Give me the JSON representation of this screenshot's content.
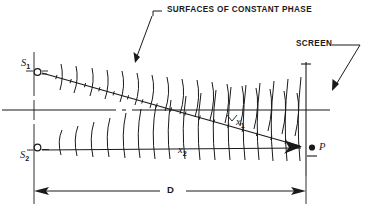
{
  "figure": {
    "kind": "optics-interference-diagram",
    "title_annotation": "SURFACES OF CONSTANT PHASE",
    "screen_annotation": "SCREEN",
    "background_color": "#ffffff",
    "ink_color": "#1a1a1a"
  },
  "labels": {
    "surfaces_of_constant_phase": "SURFACES OF CONSTANT PHASE",
    "screen": "SCREEN",
    "source_1": "S",
    "source_1_sub": "1",
    "source_2": "S",
    "source_2_sub": "2",
    "path_1": "x",
    "path_1_sub": "1",
    "path_2": "x",
    "path_2_sub": "2",
    "point_p": "P",
    "dimension_d": "D"
  },
  "geometry": {
    "source_axis_x": 34,
    "source_1_y": 72,
    "source_2_y": 148,
    "center_axis_y": 110,
    "screen_x": 306,
    "point_p_x": 312,
    "point_p_y": 148,
    "dimension_line_y": 191,
    "upper_wavefront_count": 18,
    "lower_wavefront_count": 18
  }
}
